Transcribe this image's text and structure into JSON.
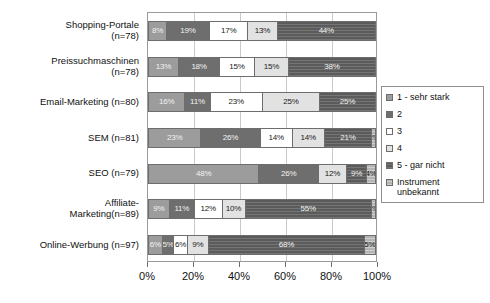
{
  "chart_data": {
    "type": "bar",
    "orientation": "horizontal",
    "stacked": true,
    "normalized_percent": true,
    "title": "",
    "subtitle": "",
    "xlabel": "",
    "ylabel": "",
    "xlim": [
      0,
      100
    ],
    "xticks": [
      "0%",
      "20%",
      "40%",
      "60%",
      "80%",
      "100%"
    ],
    "xtick_values": [
      0,
      20,
      40,
      60,
      80,
      100
    ],
    "grid": true,
    "legend_position": "right",
    "categories": [
      "Shopping-Portale\n(n=78)",
      "Preissuchmaschinen\n(n=78)",
      "Email-Marketing (n=80)",
      "SEM (n=81)",
      "SEO (n=79)",
      "Affiliate-\nMarketing(n=89)",
      "Online-Werbung (n=97)"
    ],
    "series": [
      {
        "name": "1 - sehr stark",
        "color": "#9c9c9c",
        "values": [
          8,
          13,
          16,
          23,
          48,
          9,
          6
        ]
      },
      {
        "name": "2",
        "color": "#6e6e6e",
        "values": [
          19,
          18,
          11,
          26,
          26,
          11,
          5
        ]
      },
      {
        "name": "3",
        "color": "#ffffff",
        "values": [
          17,
          15,
          23,
          14,
          0,
          12,
          6
        ]
      },
      {
        "name": "4",
        "color": "#e2e2e2",
        "values": [
          13,
          15,
          25,
          14,
          12,
          10,
          9
        ]
      },
      {
        "name": "5 - gar nicht",
        "color": "#5b5b5b",
        "values": [
          44,
          38,
          25,
          21,
          9,
          55,
          68
        ]
      },
      {
        "name": "Instrument\nunbekannt",
        "color": "#b4b4b4",
        "values": [
          0,
          0,
          0,
          2,
          4,
          2,
          5
        ]
      }
    ],
    "data_labels": [
      [
        "8%",
        "19%",
        "17%",
        "13%",
        "44%",
        ""
      ],
      [
        "13%",
        "18%",
        "15%",
        "15%",
        "38%",
        ""
      ],
      [
        "16%",
        "11%",
        "23%",
        "25%",
        "25%",
        ""
      ],
      [
        "23%",
        "26%",
        "14%",
        "14%",
        "21%",
        "2%"
      ],
      [
        "48%",
        "26%",
        "",
        "12%",
        "9%",
        "4%"
      ],
      [
        "9%",
        "11%",
        "12%",
        "10%",
        "55%",
        "2%"
      ],
      [
        "6%",
        "5%",
        "6%",
        "9%",
        "68%",
        "5%"
      ]
    ]
  },
  "legend": {
    "items": [
      {
        "label": "1 - sehr stark"
      },
      {
        "label": "2"
      },
      {
        "label": "3"
      },
      {
        "label": "4"
      },
      {
        "label": "5 - gar nicht"
      },
      {
        "label": "Instrument\nunbekannt"
      }
    ]
  }
}
